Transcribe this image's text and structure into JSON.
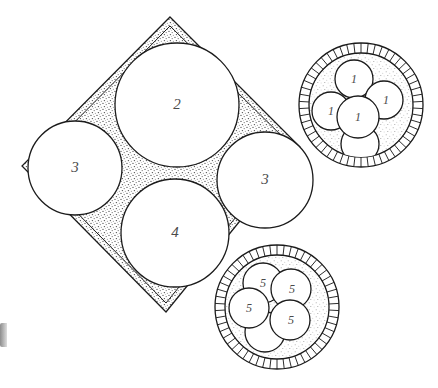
{
  "figure": {
    "background_color": "#ffffff",
    "line_color": "#1b1b1b",
    "label_color": "#4a4a4a",
    "stipple_color": "#6f6f6f"
  },
  "tray": {
    "name": "rotated-square-tray",
    "shape": "diamond",
    "corners": {
      "top": [
        170,
        17
      ],
      "right": [
        300,
        147
      ],
      "bottom": [
        166,
        312
      ],
      "left": [
        22,
        166
      ]
    },
    "has_double_border": true,
    "corner_fill": "stipple"
  },
  "tray_circles": [
    {
      "id": "c2",
      "label": "2",
      "cx": 177,
      "cy": 105,
      "r": 62
    },
    {
      "id": "c3-left",
      "label": "3",
      "cx": 75,
      "cy": 168,
      "r": 47
    },
    {
      "id": "c3-right",
      "label": "3",
      "cx": 265,
      "cy": 180,
      "r": 48
    },
    {
      "id": "c4",
      "label": "4",
      "cx": 175,
      "cy": 233,
      "r": 54
    }
  ],
  "dishes": [
    {
      "id": "dish-top-right",
      "name": "crimped-dish-upper",
      "cx": 361,
      "cy": 105,
      "outer_r": 62,
      "inner_r": 52,
      "rim_teeth": 54,
      "contents": [
        {
          "label": "1",
          "cx": 354,
          "cy": 79,
          "r": 19
        },
        {
          "label": "1",
          "cx": 331,
          "cy": 111,
          "r": 19
        },
        {
          "label": "1",
          "cx": 358,
          "cy": 117,
          "r": 21
        },
        {
          "label": "1",
          "cx": 384,
          "cy": 100,
          "r": 19
        },
        {
          "label": "",
          "cx": 360,
          "cy": 144,
          "r": 19
        }
      ]
    },
    {
      "id": "dish-bottom-right",
      "name": "crimped-dish-lower",
      "cx": 277,
      "cy": 307,
      "outer_r": 62,
      "inner_r": 52,
      "rim_teeth": 54,
      "contents": [
        {
          "label": "5",
          "cx": 263,
          "cy": 283,
          "r": 20
        },
        {
          "label": "5",
          "cx": 291,
          "cy": 289,
          "r": 20
        },
        {
          "label": "5",
          "cx": 249,
          "cy": 308,
          "r": 20
        },
        {
          "label": "5",
          "cx": 290,
          "cy": 320,
          "r": 20
        },
        {
          "label": "",
          "cx": 265,
          "cy": 332,
          "r": 20
        }
      ]
    }
  ],
  "artifact": {
    "name": "left-edge-scroll-artifact",
    "present": true
  }
}
